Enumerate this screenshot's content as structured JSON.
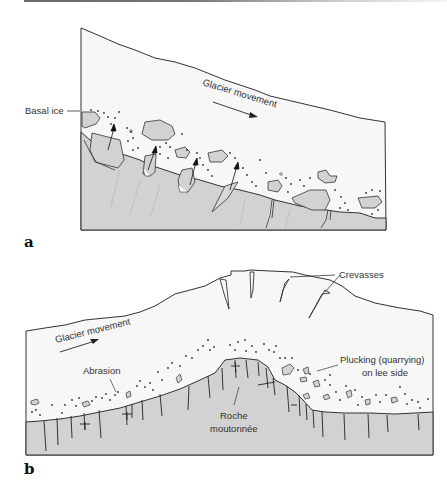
{
  "figure": {
    "panels": [
      {
        "id": "a",
        "letter": "a",
        "labels": {
          "basal_ice": "Basal ice",
          "glacier_movement": "Glacier movement"
        }
      },
      {
        "id": "b",
        "letter": "b",
        "labels": {
          "crevasses": "Crevasses",
          "glacier_movement": "Glacier movement",
          "abrasion": "Abrasion",
          "plucking_line1": "Plucking (quarrying)",
          "plucking_line2": "on lee side",
          "roche_line1": "Roche",
          "roche_line2": "moutonnée"
        }
      }
    ],
    "colors": {
      "ice": "#f7f7f7",
      "bedrock": "#d2d2d2",
      "outline": "#333333",
      "text": "#333333"
    }
  }
}
